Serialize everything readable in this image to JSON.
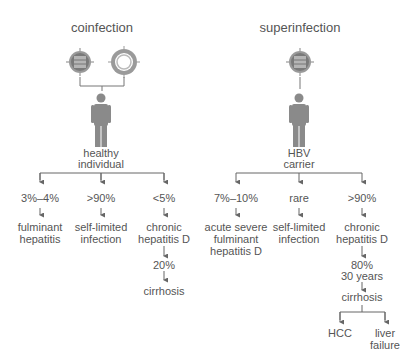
{
  "colors": {
    "text": "#555555",
    "line": "#666666",
    "icon": "#8a8a8a",
    "background": "#ffffff"
  },
  "coinfection": {
    "title": "coinfection",
    "host_label_1": "healthy",
    "host_label_2": "individual",
    "viruses": [
      "HDV-icon",
      "HBV-icon"
    ],
    "branches": [
      {
        "pct": "3%–4%",
        "outcome_1": "fulminant",
        "outcome_2": "hepatitis"
      },
      {
        "pct": ">90%",
        "outcome_1": "self-limited",
        "outcome_2": "infection"
      },
      {
        "pct": "<5%",
        "outcome_1": "chronic",
        "outcome_2": "hepatitis D",
        "next_pct": "20%",
        "next_outcome": "cirrhosis"
      }
    ]
  },
  "superinfection": {
    "title": "superinfection",
    "host_label_1": "HBV",
    "host_label_2": "carrier",
    "viruses": [
      "HDV-icon"
    ],
    "branches": [
      {
        "pct": "7%–10%",
        "outcome_1": "acute severe",
        "outcome_2": "fulminant",
        "outcome_3": "hepatitis D"
      },
      {
        "pct": "rare",
        "outcome_1": "self-limited",
        "outcome_2": "infection"
      },
      {
        "pct": ">90%",
        "outcome_1": "chronic",
        "outcome_2": "hepatitis D",
        "next_pct": "80%",
        "next_time": "30 years",
        "next_outcome": "cirrhosis",
        "final": [
          {
            "label_1": "HCC"
          },
          {
            "label_1": "liver",
            "label_2": "failure"
          }
        ]
      }
    ]
  }
}
